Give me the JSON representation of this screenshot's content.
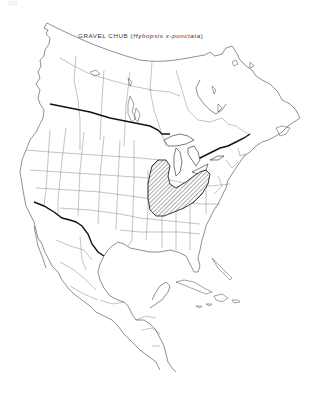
{
  "page": {
    "page_number": "102"
  },
  "map": {
    "title_common": "GRAVEL CHUB",
    "title_scientific": "Hybopsis x-punctata",
    "title_open": "(",
    "title_close": ")",
    "region": "North America",
    "range_description": "Hatched range over Great Lakes / Ohio River basin region",
    "colors": {
      "background": "#ffffff",
      "lines": "#333333",
      "range_hatch": "#333333"
    }
  }
}
